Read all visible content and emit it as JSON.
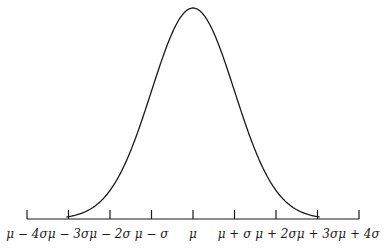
{
  "chart_data": {
    "type": "line",
    "title": "",
    "subtitle": "Normal distribution curve",
    "xlabel": "",
    "ylabel": "",
    "grid": false,
    "legend": null,
    "x_ticks": [
      "μ − 4σ",
      "μ − 3σ",
      "μ − 2σ",
      "μ − σ",
      "μ",
      "μ + σ",
      "μ + 2σ",
      "μ + 3σ",
      "μ + 4σ"
    ],
    "x": [
      -4,
      -3,
      -2,
      -1,
      0,
      1,
      2,
      3,
      4
    ],
    "series": [
      {
        "name": "density",
        "values": [
          0.0001,
          0.0044,
          0.054,
          0.242,
          0.399,
          0.242,
          0.054,
          0.0044,
          0.0001
        ]
      }
    ],
    "xlim": [
      -4,
      4
    ],
    "colors": {
      "curve": "#1a1a1a",
      "axis": "#1a1a1a"
    }
  }
}
